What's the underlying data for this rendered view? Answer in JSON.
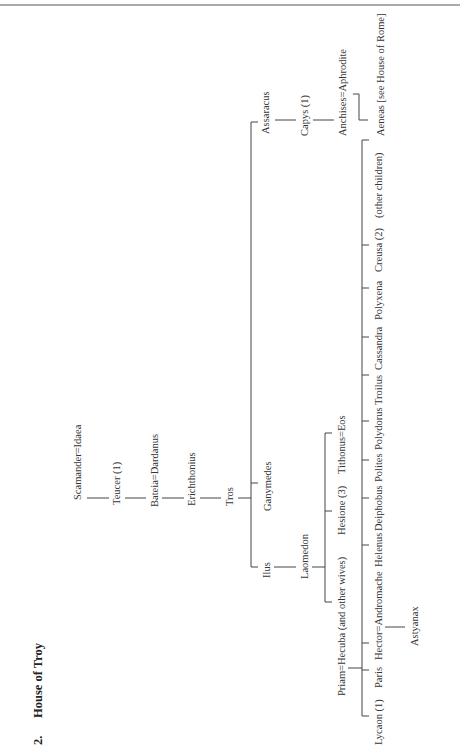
{
  "header": {
    "number": "2.",
    "title": "House of Troy"
  },
  "tree": {
    "scamander": "Scamander=Idaea",
    "teucer": "Teucer (1)",
    "bateia": "Bateia=Dardanus",
    "erichthonius": "Erichthonius",
    "tros": "Tros",
    "ilus": "Ilus",
    "ganymedes": "Ganymedes",
    "assaracus": "Assaracus",
    "capys": "Capys (1)",
    "anchises": "Anchises=Aphrodite",
    "aeneas": "Aeneas [see House of Rome]",
    "laomedon": "Laomedon",
    "priam": "Priam=Hecuba (and other wives)",
    "hesione": "Hesione (3)",
    "tithonus": "Tithonus=Eos",
    "children": [
      "Lycaon (1)",
      "Paris",
      "Hector=Andromache",
      "Helenus",
      "Deiphobus",
      "Polites",
      "Polydorus",
      "Troilus",
      "Cassandra",
      "Polyxena",
      "Creusa (2)",
      "(other children)"
    ],
    "astyanax": "Astyanax"
  }
}
